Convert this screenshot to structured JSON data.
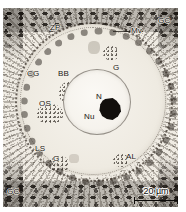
{
  "figure": {
    "kind": "light-micrograph-oocyte-follicle",
    "tone": "grayscale-sepia",
    "frame": {
      "left": 3,
      "top": 8,
      "width": 175,
      "height": 199
    }
  },
  "labels": [
    {
      "id": "zp",
      "text": "ZP",
      "name": "label-zona-pellucida",
      "x": 50,
      "y": 24,
      "leader": null
    },
    {
      "id": "gc_top",
      "text": "GC",
      "name": "label-granulosa-cells-top",
      "x": 158,
      "y": 17,
      "leader": null
    },
    {
      "id": "mv",
      "text": "Mv",
      "name": "label-microvilli",
      "x": 131,
      "y": 27,
      "leader": {
        "x": 113,
        "y": 31,
        "w": 17
      }
    },
    {
      "id": "cg",
      "text": "CG",
      "name": "label-cortical-granules",
      "x": 27,
      "y": 70,
      "leader": null
    },
    {
      "id": "bb",
      "text": "BB",
      "name": "label-balbiani-body",
      "x": 58,
      "y": 70,
      "leader": null
    },
    {
      "id": "g_top",
      "text": "G",
      "name": "label-golgi-upper",
      "x": 113,
      "y": 64,
      "leader": null
    },
    {
      "id": "os",
      "text": "OS",
      "name": "label-ooplasmic-sheets",
      "x": 39,
      "y": 100,
      "leader": null
    },
    {
      "id": "n",
      "text": "N",
      "name": "label-nucleus",
      "x": 96,
      "y": 93,
      "leader": null
    },
    {
      "id": "nu",
      "text": "Nu",
      "name": "label-nucleolus",
      "x": 84,
      "y": 113,
      "leader": null
    },
    {
      "id": "ls",
      "text": "LS",
      "name": "label-lamellar-structures",
      "x": 35,
      "y": 145,
      "leader": null
    },
    {
      "id": "g_bot",
      "text": "G",
      "name": "label-golgi-lower",
      "x": 53,
      "y": 155,
      "leader": null
    },
    {
      "id": "al",
      "text": "AL",
      "name": "label-annulate-lamellae",
      "x": 126,
      "y": 153,
      "leader": null
    },
    {
      "id": "gc_bot",
      "text": "GC",
      "name": "label-granulosa-cells-bottom",
      "x": 7,
      "y": 188,
      "leader": null
    }
  ],
  "scalebar": {
    "text": "20 µm",
    "value": 20,
    "unit": "µm",
    "bar_length_px": 44
  },
  "colors": {
    "paper": "#ffffff",
    "plate_base": "#efebe3",
    "ink": "#1b1714",
    "nucleolus": "#120f0c",
    "rule": "#0d0b09"
  }
}
